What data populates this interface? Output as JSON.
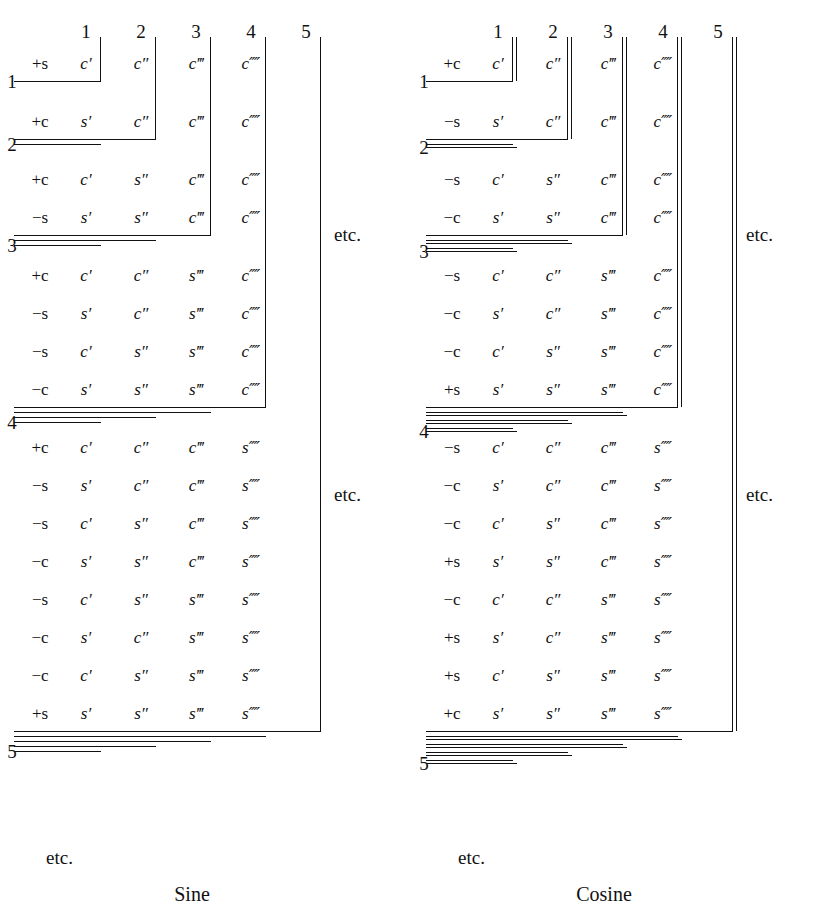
{
  "figure": {
    "columns": [
      "1",
      "2",
      "3",
      "4",
      "5"
    ],
    "row_groups": [
      "1",
      "2",
      "3",
      "4",
      "5"
    ],
    "etc_label": "etc.",
    "panels": [
      {
        "id": "sine",
        "caption": "Sine",
        "col_headers": [
          "1",
          "2",
          "3",
          "4",
          "5"
        ],
        "group_labels": [
          "1",
          "2",
          "3",
          "4",
          "5"
        ],
        "etc_right": "etc.",
        "etc_right2": "etc.",
        "etc_bottom": "etc.",
        "groups": [
          {
            "label": "1",
            "depth": 1,
            "rows": [
              {
                "sign": "+s",
                "terms": [
                  "c′",
                  "c″",
                  "c‴",
                  "c⁗"
                ]
              }
            ]
          },
          {
            "label": "2",
            "depth": 2,
            "rows": [
              {
                "sign": "+c",
                "terms": [
                  "s′",
                  "c″",
                  "c‴",
                  "c⁗"
                ]
              }
            ]
          },
          {
            "label": "3",
            "depth": 3,
            "rows": [
              {
                "sign": "+c",
                "terms": [
                  "c′",
                  "s″",
                  "c‴",
                  "c⁗"
                ]
              },
              {
                "sign": "−s",
                "terms": [
                  "s′",
                  "s″",
                  "c‴",
                  "c⁗"
                ]
              }
            ]
          },
          {
            "label": "4",
            "depth": 4,
            "rows": [
              {
                "sign": "+c",
                "terms": [
                  "c′",
                  "c″",
                  "s‴",
                  "c⁗"
                ]
              },
              {
                "sign": "−s",
                "terms": [
                  "s′",
                  "c″",
                  "s‴",
                  "c⁗"
                ]
              },
              {
                "sign": "−s",
                "terms": [
                  "c′",
                  "s″",
                  "s‴",
                  "c⁗"
                ]
              },
              {
                "sign": "−c",
                "terms": [
                  "s′",
                  "s″",
                  "s‴",
                  "c⁗"
                ]
              }
            ]
          },
          {
            "label": "5",
            "depth": 5,
            "rows": [
              {
                "sign": "+c",
                "terms": [
                  "c′",
                  "c″",
                  "c‴",
                  "s⁗"
                ]
              },
              {
                "sign": "−s",
                "terms": [
                  "s′",
                  "c″",
                  "c‴",
                  "s⁗"
                ]
              },
              {
                "sign": "−s",
                "terms": [
                  "c′",
                  "s″",
                  "c‴",
                  "s⁗"
                ]
              },
              {
                "sign": "−c",
                "terms": [
                  "s′",
                  "s″",
                  "c‴",
                  "s⁗"
                ]
              },
              {
                "sign": "−s",
                "terms": [
                  "c′",
                  "s″",
                  "s‴",
                  "s⁗"
                ]
              },
              {
                "sign": "−c",
                "terms": [
                  "s′",
                  "c″",
                  "s‴",
                  "s⁗"
                ]
              },
              {
                "sign": "−c",
                "terms": [
                  "c′",
                  "s″",
                  "s‴",
                  "s⁗"
                ]
              },
              {
                "sign": "+s",
                "terms": [
                  "s′",
                  "s″",
                  "s‴",
                  "s⁗"
                ]
              }
            ]
          }
        ]
      },
      {
        "id": "cosine",
        "caption": "Cosine",
        "col_headers": [
          "1",
          "2",
          "3",
          "4",
          "5"
        ],
        "group_labels": [
          "1",
          "2",
          "3",
          "4",
          "5"
        ],
        "etc_right": "etc.",
        "etc_right2": "etc.",
        "etc_bottom": "etc.",
        "groups": [
          {
            "label": "1",
            "depth": 1,
            "rows": [
              {
                "sign": "+c",
                "terms": [
                  "c′",
                  "c″",
                  "c‴",
                  "c⁗"
                ]
              }
            ]
          },
          {
            "label": "2",
            "depth": 2,
            "rows": [
              {
                "sign": "−s",
                "terms": [
                  "s′",
                  "c″",
                  "c‴",
                  "c⁗"
                ]
              }
            ]
          },
          {
            "label": "3",
            "depth": 3,
            "rows": [
              {
                "sign": "−s",
                "terms": [
                  "c′",
                  "s″",
                  "c‴",
                  "c⁗"
                ]
              },
              {
                "sign": "−c",
                "terms": [
                  "s′",
                  "s″",
                  "c‴",
                  "c⁗"
                ]
              }
            ]
          },
          {
            "label": "4",
            "depth": 4,
            "rows": [
              {
                "sign": "−s",
                "terms": [
                  "c′",
                  "c″",
                  "s‴",
                  "c⁗"
                ]
              },
              {
                "sign": "−c",
                "terms": [
                  "s′",
                  "c″",
                  "s‴",
                  "c⁗"
                ]
              },
              {
                "sign": "−c",
                "terms": [
                  "c′",
                  "s″",
                  "s‴",
                  "c⁗"
                ]
              },
              {
                "sign": "+s",
                "terms": [
                  "s′",
                  "s″",
                  "s‴",
                  "c⁗"
                ]
              }
            ]
          },
          {
            "label": "5",
            "depth": 5,
            "rows": [
              {
                "sign": "−s",
                "terms": [
                  "c′",
                  "c″",
                  "c‴",
                  "s⁗"
                ]
              },
              {
                "sign": "−c",
                "terms": [
                  "s′",
                  "c″",
                  "c‴",
                  "s⁗"
                ]
              },
              {
                "sign": "−c",
                "terms": [
                  "c′",
                  "s″",
                  "c‴",
                  "s⁗"
                ]
              },
              {
                "sign": "+s",
                "terms": [
                  "s′",
                  "s″",
                  "c‴",
                  "s⁗"
                ]
              },
              {
                "sign": "−c",
                "terms": [
                  "c′",
                  "c″",
                  "s‴",
                  "s⁗"
                ]
              },
              {
                "sign": "+s",
                "terms": [
                  "s′",
                  "c″",
                  "s‴",
                  "s⁗"
                ]
              },
              {
                "sign": "+s",
                "terms": [
                  "c′",
                  "s″",
                  "s‴",
                  "s⁗"
                ]
              },
              {
                "sign": "+c",
                "terms": [
                  "s′",
                  "s″",
                  "s‴",
                  "s⁗"
                ]
              }
            ]
          }
        ]
      }
    ]
  }
}
